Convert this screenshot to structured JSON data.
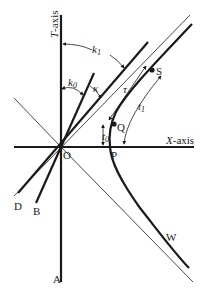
{
  "diagram": {
    "axes": {
      "t_axis_label": "T-axis",
      "x_axis_label": "X-axis"
    },
    "points": {
      "origin": "O",
      "P": "P",
      "Q": "Q",
      "S": "S",
      "W": "W",
      "A": "A",
      "B": "B",
      "D": "D"
    },
    "angles": {
      "k0": "k",
      "k0_sub": "0",
      "k1": "k",
      "k1_sub": "1",
      "kappa": "κ"
    },
    "intervals": {
      "tau": "τ",
      "t0": "t",
      "t0_sub": "0",
      "t1": "t",
      "t1_sub": "1"
    },
    "colors": {
      "ink": "#1a1a1a",
      "background": "#ffffff"
    }
  }
}
